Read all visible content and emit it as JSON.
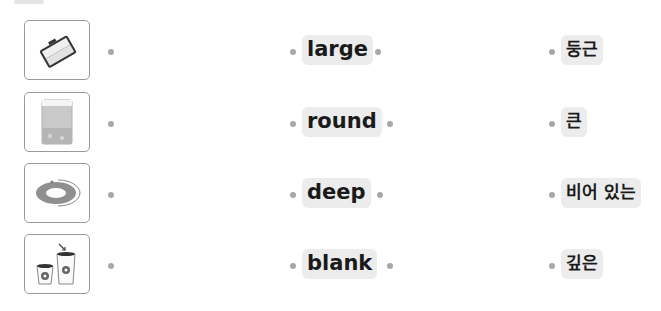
{
  "exercise": {
    "type": "matching",
    "rows": [
      {
        "image": "open-suitcase-icon",
        "word": "large",
        "meaning": "둥근"
      },
      {
        "image": "water-tank-icon",
        "word": "round",
        "meaning": "큰"
      },
      {
        "image": "ring-plate-icon",
        "word": "deep",
        "meaning": "비어 있는"
      },
      {
        "image": "paper-cups-icon",
        "word": "blank",
        "meaning": "깊은"
      }
    ]
  },
  "colors": {
    "label_bg": "#ececec",
    "dot": "#a8a8a8",
    "border": "#9a9a9a",
    "text": "#1a1a1a"
  }
}
